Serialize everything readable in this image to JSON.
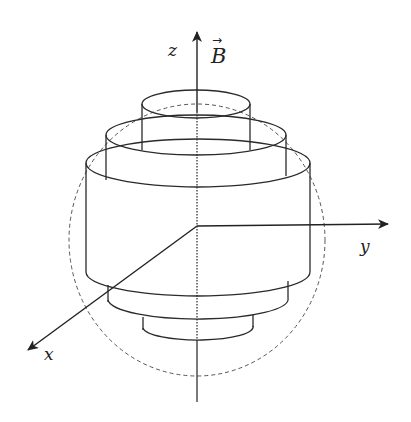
{
  "diagram": {
    "axes": {
      "z_label": "z",
      "y_label": "y",
      "x_label": "x",
      "field_label": "B",
      "field_arrow": "→"
    },
    "colors": {
      "stroke": "#2a2a2a",
      "dashed_sphere": "#555555",
      "background": "#ffffff"
    },
    "cylinders": [
      {
        "name": "top",
        "left": 142,
        "right": 250,
        "top_y": 104,
        "bottom_y": 148
      },
      {
        "name": "upper",
        "left": 106,
        "right": 286,
        "top_y": 135,
        "bottom_y": 163
      },
      {
        "name": "middle",
        "left": 86,
        "right": 310,
        "top_y": 163,
        "bottom_y": 275
      },
      {
        "name": "lower",
        "left": 108,
        "right": 288,
        "top_y": 285,
        "bottom_y": 310
      },
      {
        "name": "bottom",
        "left": 143,
        "right": 253,
        "top_y": 315,
        "bottom_y": 340
      }
    ]
  }
}
